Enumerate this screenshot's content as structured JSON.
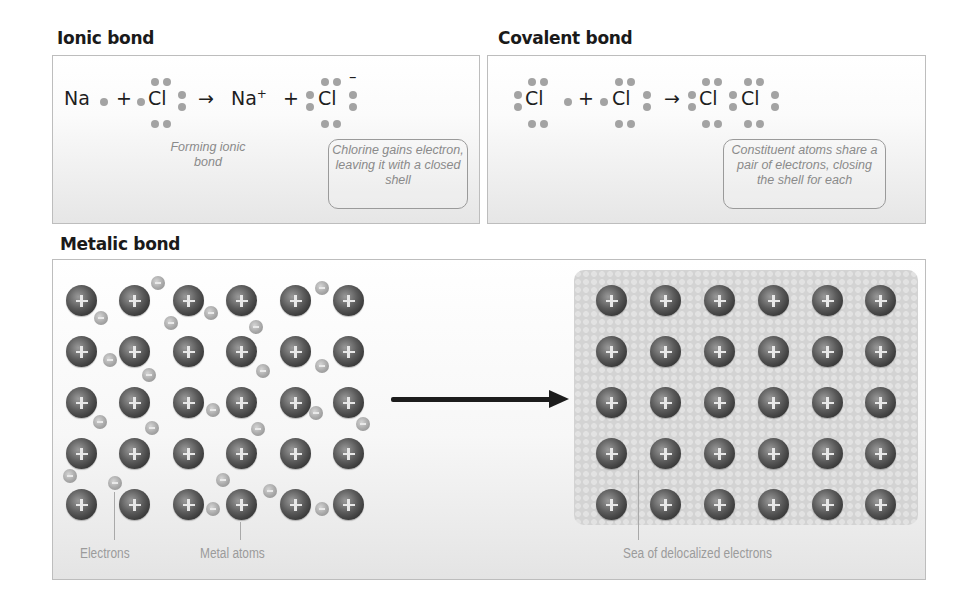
{
  "ionic": {
    "title": "Ionic bond",
    "eq": {
      "na": "Na",
      "plus1": "+",
      "cl1": "Cl",
      "arrow": "→",
      "na_ion": "Na",
      "na_charge": "+",
      "plus2": "+",
      "cl2": "Cl",
      "cl_charge": "–"
    },
    "caption": "Forming ionic bond",
    "callout": "Chlorine gains electron, leaving it with a closed shell"
  },
  "covalent": {
    "title": "Covalent bond",
    "eq": {
      "cl1": "Cl",
      "plus": "+",
      "cl2": "Cl",
      "arrow": "→",
      "cl3": "Cl",
      "cl4": "Cl"
    },
    "callout": "Constituent atoms share a pair of electrons, closing the shell for each"
  },
  "metallic": {
    "title": "Metalic bond",
    "labels": {
      "electrons": "Electrons",
      "metal_atoms": "Metal atoms",
      "sea": "Sea of delocalized electrons"
    },
    "grid": {
      "rows": 5,
      "cols": 6,
      "atom_symbol": "+",
      "electron_symbol": "−"
    }
  },
  "colors": {
    "atom": "#4a4a4a",
    "electron": "#a8a8a8",
    "label": "#9b9b9b",
    "arrow": "#1c1c1c",
    "panel_border": "#bdbdbd"
  }
}
